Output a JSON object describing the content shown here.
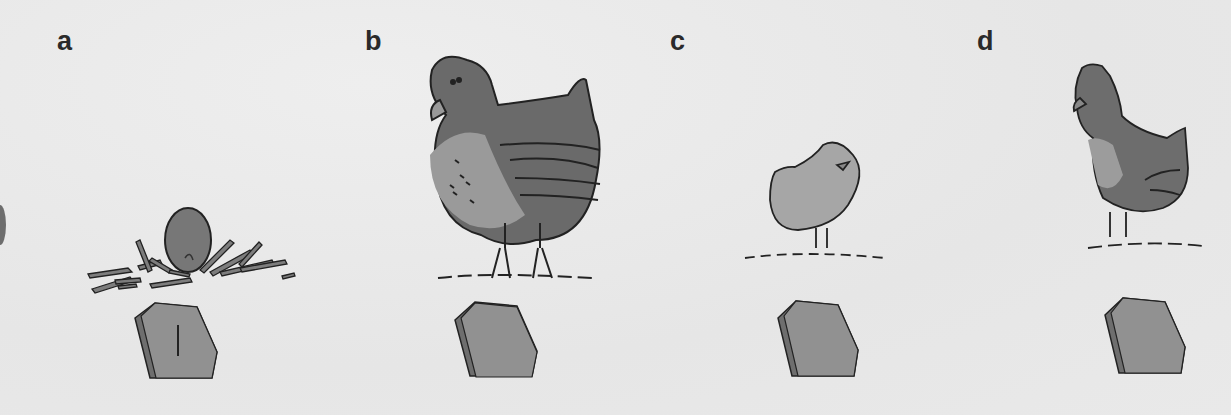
{
  "figure": {
    "panels": [
      {
        "id": "a",
        "label": "a",
        "subject": "egg-in-nest",
        "stone_mark": "|"
      },
      {
        "id": "b",
        "label": "b",
        "subject": "hen",
        "stone_mark": ""
      },
      {
        "id": "c",
        "label": "c",
        "subject": "chick",
        "stone_mark": ""
      },
      {
        "id": "d",
        "label": "d",
        "subject": "young-chicken",
        "stone_mark": ""
      }
    ],
    "colors": {
      "background": "#ebebeb",
      "ink": "#222222",
      "dark_fill": "#6a6a6a",
      "mid_fill": "#8a8a8a",
      "light_fill": "#a9a9a9",
      "stone_fill": "#8f8f8f",
      "stone_edge": "#6e6e6e"
    }
  }
}
